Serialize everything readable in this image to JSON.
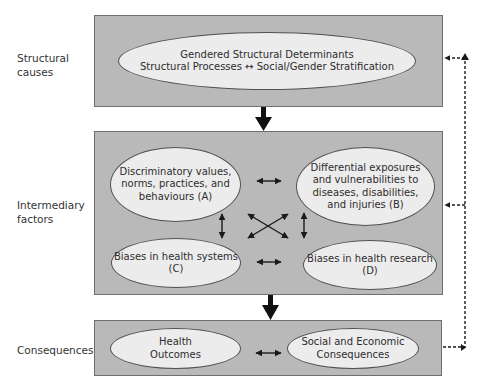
{
  "diagram": {
    "rows": [
      {
        "label_line1": "Structural",
        "label_line2": "causes",
        "nodes": [
          {
            "id": "structural",
            "line1": "Gendered Structural Determinants",
            "line2": "Structural Processes ↔ Social/Gender Stratification"
          }
        ]
      },
      {
        "label_line1": "Intermediary",
        "label_line2": "factors",
        "nodes": [
          {
            "id": "A",
            "line1": "Discriminatory values,",
            "line2": "norms, practices, and",
            "line3": "behaviours (A)"
          },
          {
            "id": "B",
            "line1": "Differential exposures",
            "line2": "and vulnerabilities to",
            "line3": "diseases, disabilities,",
            "line4": "and injuries (B)"
          },
          {
            "id": "C",
            "line1": "Biases in health systems",
            "line2": "(C)"
          },
          {
            "id": "D",
            "line1": "Biases in health research",
            "line2": "(D)"
          }
        ]
      },
      {
        "label_line1": "Consequences",
        "nodes": [
          {
            "id": "health",
            "line1": "Health",
            "line2": "Outcomes"
          },
          {
            "id": "social",
            "line1": "Social and Economic",
            "line2": "Consequences"
          }
        ]
      }
    ],
    "edges": [
      {
        "from": "structural-box",
        "to": "intermediary-box",
        "type": "solid-thick"
      },
      {
        "from": "intermediary-box",
        "to": "consequences-box",
        "type": "solid-thick"
      },
      {
        "from": "A",
        "to": "B",
        "type": "bidirectional"
      },
      {
        "from": "A",
        "to": "C",
        "type": "bidirectional"
      },
      {
        "from": "A",
        "to": "D",
        "type": "bidirectional"
      },
      {
        "from": "B",
        "to": "C",
        "type": "bidirectional"
      },
      {
        "from": "B",
        "to": "D",
        "type": "bidirectional"
      },
      {
        "from": "C",
        "to": "D",
        "type": "bidirectional"
      },
      {
        "from": "health",
        "to": "social",
        "type": "bidirectional"
      },
      {
        "from": "consequences-box",
        "to": "intermediary-box",
        "type": "dashed-feedback"
      },
      {
        "from": "consequences-box",
        "to": "structural-box",
        "type": "dashed-feedback"
      }
    ],
    "colors": {
      "box_fill": "#b9b9b9",
      "ellipse_fill": "#ececec",
      "line": "#1a1a1a"
    }
  }
}
